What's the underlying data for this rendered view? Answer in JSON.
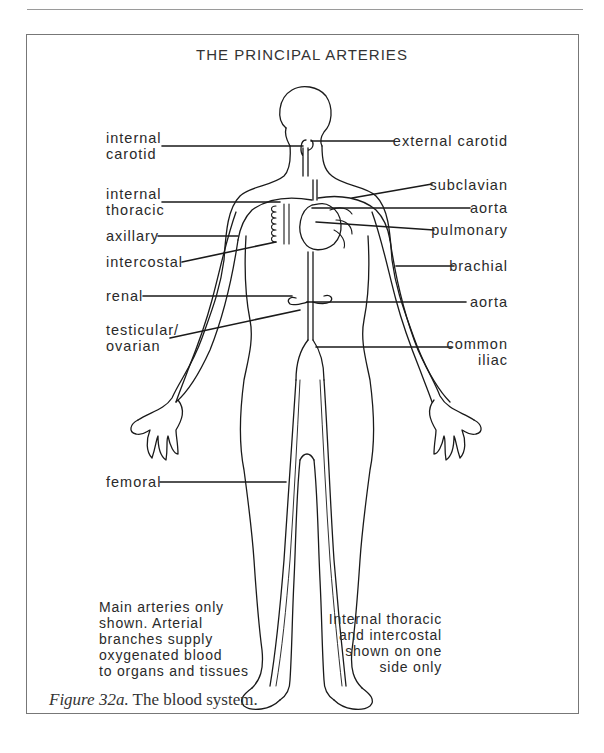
{
  "figure": {
    "title": "THE PRINCIPAL ARTERIES",
    "labels_left": [
      {
        "id": "internal-carotid",
        "text": "internal\ncarotid"
      },
      {
        "id": "internal-thoracic",
        "text": "internal\nthoracic"
      },
      {
        "id": "axillary",
        "text": "axillary"
      },
      {
        "id": "intercostal",
        "text": "intercostal"
      },
      {
        "id": "renal",
        "text": "renal"
      },
      {
        "id": "testicular-ovarian",
        "text": "testicular/\novarian"
      },
      {
        "id": "femoral",
        "text": "femoral"
      }
    ],
    "labels_right": [
      {
        "id": "external-carotid",
        "text": "external carotid"
      },
      {
        "id": "subclavian",
        "text": "subclavian"
      },
      {
        "id": "aorta-upper",
        "text": "aorta"
      },
      {
        "id": "pulmonary",
        "text": "pulmonary"
      },
      {
        "id": "brachial",
        "text": "brachial"
      },
      {
        "id": "aorta-lower",
        "text": "aorta"
      },
      {
        "id": "common-iliac",
        "text": "common\niliac"
      }
    ],
    "note_left": "Main arteries only\nshown. Arterial\nbranches supply\noxygenated blood\nto organs and tissues",
    "note_right": "Internal thoracic\nand intercostal\nshown on one\nside only",
    "caption_label": "Figure 32a.",
    "caption_text": " The blood system."
  },
  "colors": {
    "line": "#1a1a1a",
    "frame": "#777777",
    "text": "#2a2a2a"
  }
}
